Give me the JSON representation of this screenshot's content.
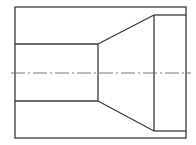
{
  "diagram": {
    "type": "technical-section-drawing",
    "colors": {
      "background": "#ffffff",
      "outline": "#3a3a3a",
      "centerline": "#6a6a6a"
    },
    "outer_rect": {
      "x1": 15,
      "y1": 7,
      "x2": 186,
      "y2": 138
    },
    "bore": {
      "x1": 15,
      "x2": 98,
      "y_top": 44,
      "y_bottom": 101
    },
    "taper": {
      "x_start": 98,
      "x_end": 154,
      "y_top_start": 44,
      "y_top_end": 15,
      "y_bottom_start": 101,
      "y_bottom_end": 131
    },
    "counterbore": {
      "x1": 154,
      "x2": 186,
      "y_top": 15,
      "y_bottom": 131
    },
    "centerline": {
      "x1": 11,
      "x2": 191,
      "y": 73,
      "dash_pattern": "14 3 2 3"
    }
  }
}
